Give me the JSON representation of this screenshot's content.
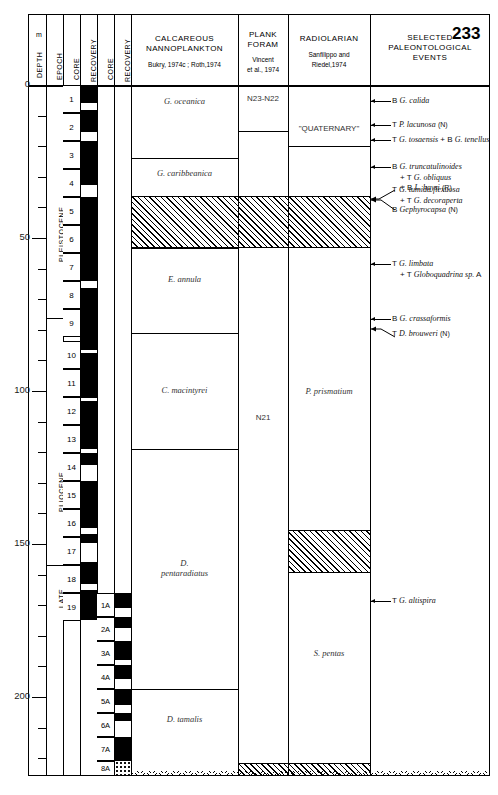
{
  "page_number": "233",
  "columns": {
    "depth": {
      "title": "DEPTH",
      "unit": "m"
    },
    "epoch": {
      "title": "EPOCH"
    },
    "core1": {
      "title": "CORE"
    },
    "recovery1": {
      "title": "RECOVERY"
    },
    "core2": {
      "title": "CORE"
    },
    "recovery2": {
      "title": "RECOVERY"
    },
    "nanno": {
      "title_line1": "CALCAREOUS",
      "title_line2": "NANNOPLANKTON",
      "subtitle": "Bukry, 1974c ; Roth,1974"
    },
    "foram": {
      "title_line1": "PLANK",
      "title_line2": "FORAM",
      "subtitle_line1": "Vincent",
      "subtitle_line2": "et al., 1974"
    },
    "radiolarian": {
      "title": "RADIOLARIAN",
      "subtitle_line1": "Sanfilippo and",
      "subtitle_line2": "Riedel,1974"
    },
    "events": {
      "title_line1": "SELECTED",
      "title_line2": "PALEONTOLOGICAL",
      "title_line3": "EVENTS"
    }
  },
  "depth_scale": {
    "labels": [
      "0",
      "50",
      "100",
      "150",
      "200"
    ],
    "minor_interval_m": 10,
    "max_depth_m": 220
  },
  "epochs": [
    {
      "label": "PLEISTOCENE"
    },
    {
      "label": "PLIOCENE"
    },
    {
      "label": "LATE"
    }
  ],
  "cores_hole1": [
    "1",
    "2",
    "3",
    "4",
    "5",
    "6",
    "7",
    "8",
    "9",
    "10",
    "11",
    "12",
    "13",
    "14",
    "15",
    "16",
    "17",
    "18",
    "19"
  ],
  "cores_hole2": [
    "1A",
    "2A",
    "3A",
    "4A",
    "5A",
    "6A",
    "7A",
    "8A"
  ],
  "nanno_zones": [
    {
      "label": "G. oceanica"
    },
    {
      "label": "G. caribbeanica"
    },
    {
      "label": "E. annula"
    },
    {
      "label": "C. macintyrei"
    },
    {
      "label": "D.",
      "label2": "pentaradiatus"
    },
    {
      "label": "D. tamalis"
    }
  ],
  "foram_zones": [
    {
      "label": "N23-N22"
    },
    {
      "label": "N21"
    }
  ],
  "radiolarian_zones": [
    {
      "label": "\"QUATERNARY\""
    },
    {
      "label": "P. prismatium"
    },
    {
      "label": "S. pentas"
    }
  ],
  "events": [
    {
      "lines": [
        "B G. calida"
      ]
    },
    {
      "lines": [
        "T P. lacunosa (N)"
      ]
    },
    {
      "lines": [
        "T G. tosaensis + B G. tenellus"
      ]
    },
    {
      "lines": [
        "B G. truncatulinoides",
        "+ T G. obliquus",
        "+ B L. haysi (R)"
      ]
    },
    {
      "lines": [
        "T G. tumida flexuosa",
        "+ T G. decoraperta"
      ]
    },
    {
      "lines": [
        "B Gephyrocapsa (N)"
      ]
    },
    {
      "lines": [
        "T G. limbata",
        "+ T Globoquadrina sp. A"
      ]
    },
    {
      "lines": [
        "B G. crassaformis"
      ]
    },
    {
      "lines": [
        "T D. brouweri (N)"
      ]
    },
    {
      "lines": [
        "T G. altispira"
      ]
    }
  ]
}
